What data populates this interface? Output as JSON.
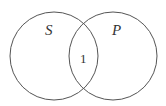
{
  "diagram": {
    "type": "venn",
    "sets": [
      {
        "label": "S",
        "cx": 54,
        "cy": 56,
        "r": 44
      },
      {
        "label": "P",
        "cx": 113,
        "cy": 56,
        "r": 44
      }
    ],
    "intersection_label": "1",
    "stroke_color": "#555555"
  }
}
